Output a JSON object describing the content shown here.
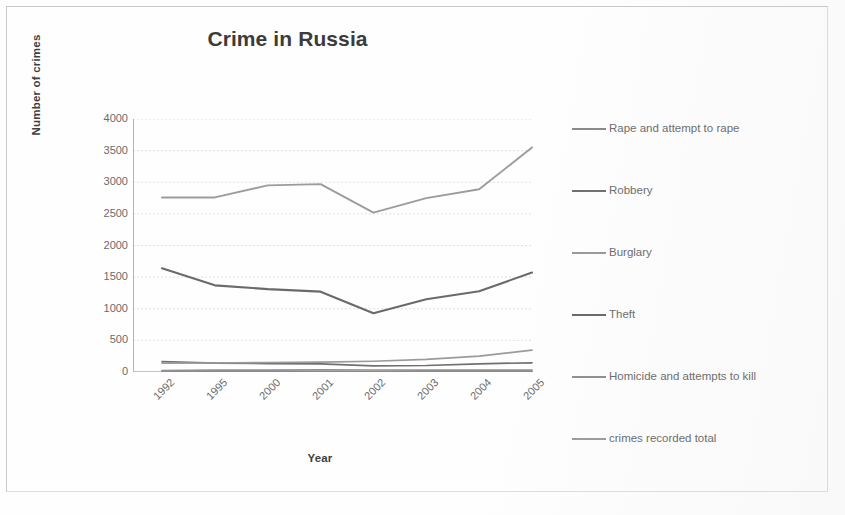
{
  "chart_data": {
    "type": "line",
    "title": "Crime in Russia",
    "xlabel": "Year",
    "ylabel": "Number of crimes",
    "categories": [
      "1992",
      "1995",
      "2000",
      "2001",
      "2002",
      "2003",
      "2004",
      "2005"
    ],
    "ylim": [
      0,
      4000
    ],
    "ytick_step": 500,
    "yticks": [
      "4000",
      "3500",
      "3000",
      "2500",
      "2000",
      "1500",
      "1000",
      "500",
      "0"
    ],
    "grid": true,
    "legend_position": "right",
    "series": [
      {
        "name": "Rape and attempt to rape",
        "color": "#8a8a8a",
        "values": [
          14,
          13,
          8,
          8,
          8,
          8,
          9,
          9
        ]
      },
      {
        "name": "Robbery",
        "color": "#707070",
        "values": [
          165,
          141,
          132,
          128,
          97,
          103,
          130,
          145
        ]
      },
      {
        "name": "Burglary",
        "color": "#9a9a9a",
        "values": [
          140,
          142,
          150,
          155,
          170,
          199,
          251,
          345
        ]
      },
      {
        "name": "Theft",
        "color": "#6a6a6a",
        "values": [
          1640,
          1370,
          1310,
          1270,
          930,
          1150,
          1277,
          1573
        ]
      },
      {
        "name": "Homicide and attempts to kill",
        "color": "#909090",
        "values": [
          23,
          31,
          31,
          33,
          32,
          31,
          31,
          30
        ]
      },
      {
        "name": "crimes recorded total",
        "color": "#9c9c9c",
        "values": [
          2760,
          2760,
          2950,
          2970,
          2520,
          2750,
          2890,
          3550
        ]
      }
    ]
  },
  "legend": {
    "items": [
      {
        "label": "Rape and attempt to rape"
      },
      {
        "label": "Robbery"
      },
      {
        "label": "Burglary"
      },
      {
        "label": "Theft"
      },
      {
        "label": "Homicide and attempts to kill"
      },
      {
        "label": "crimes recorded total"
      }
    ]
  }
}
